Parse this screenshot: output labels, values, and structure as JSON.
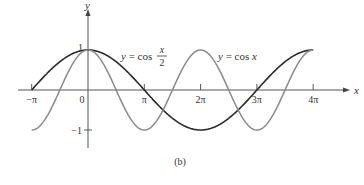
{
  "chart_data": {
    "type": "line",
    "title": "",
    "caption": "(b)",
    "xlabel": "x",
    "ylabel": "y",
    "x_ticks": [
      "−π",
      "0",
      "π",
      "2π",
      "3π",
      "4π"
    ],
    "x_tick_values": [
      -3.14159,
      0,
      3.14159,
      6.28319,
      9.42478,
      12.56637
    ],
    "y_ticks": [
      "1",
      "−1"
    ],
    "y_tick_values": [
      1,
      -1
    ],
    "xlim": [
      -3.14159,
      12.56637
    ],
    "ylim": [
      -1,
      1
    ],
    "grid": false,
    "series": [
      {
        "name": "y = cos(x/2)",
        "label_main": "y = cos",
        "label_num": "x",
        "label_den": "2",
        "color": "#2a2a2a",
        "domain": [
          -3.14159,
          12.56637
        ],
        "x": [
          -3.14159,
          0,
          3.14159,
          6.28319,
          9.42478,
          12.56637
        ],
        "values": [
          0,
          1,
          0,
          -1,
          0,
          1
        ]
      },
      {
        "name": "y = cos x",
        "label": "y = cos x",
        "color": "#8a8a8a",
        "domain": [
          -3.14159,
          12.56637
        ],
        "x": [
          -3.14159,
          0,
          3.14159,
          6.28319,
          9.42478,
          12.56637
        ],
        "values": [
          -1,
          1,
          -1,
          1,
          -1,
          1
        ]
      }
    ]
  },
  "layout": {
    "origin_x": 88,
    "origin_y": 90,
    "px_per_pi": 56.3,
    "px_per_unit_y": 40,
    "x_axis_start": 18,
    "x_axis_end": 345,
    "y_axis_top": 14,
    "y_axis_bottom": 148
  }
}
